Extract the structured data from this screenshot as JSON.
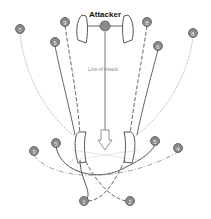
{
  "title": "Attacker",
  "center_label": "Line of Attack",
  "colors": {
    "line": "#5a5a5a",
    "dash": "#7a7a7a",
    "dot": "#9a9a9a",
    "node_fill": "#8a8a8a",
    "node_stroke": "#555555",
    "node_text": "#f0f0f0",
    "title": "#111111",
    "caption": "#8a8a8a"
  },
  "nodes": [
    {
      "id": "attacker",
      "label": "",
      "x": 105,
      "y": 26
    },
    {
      "id": "n7",
      "label": "7",
      "x": 20,
      "y": 29
    },
    {
      "id": "n9",
      "label": "9",
      "x": 65,
      "y": 22
    },
    {
      "id": "n5-top",
      "label": "5",
      "x": 55,
      "y": 42
    },
    {
      "id": "n8-top",
      "label": "8",
      "x": 147,
      "y": 22
    },
    {
      "id": "n6",
      "label": "6",
      "x": 158,
      "y": 46
    },
    {
      "id": "n8",
      "label": "8",
      "x": 193,
      "y": 33
    },
    {
      "id": "n3-left",
      "label": "3",
      "x": 34,
      "y": 151
    },
    {
      "id": "n5-left",
      "label": "5",
      "x": 56,
      "y": 143
    },
    {
      "id": "n5-right",
      "label": "5",
      "x": 155,
      "y": 141
    },
    {
      "id": "n4",
      "label": "4",
      "x": 178,
      "y": 148
    },
    {
      "id": "n1",
      "label": "1",
      "x": 84,
      "y": 201
    },
    {
      "id": "n2",
      "label": "2",
      "x": 130,
      "y": 201
    }
  ]
}
